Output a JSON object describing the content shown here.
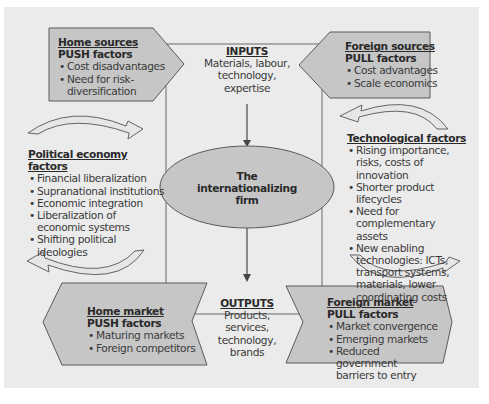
{
  "colors": {
    "background_panel": "#ebebeb",
    "shape_fill": "#c6c6c6",
    "shape_stroke": "#5a5a5a",
    "text": "#3a3a3a",
    "heading_text": "#2a2a2a"
  },
  "home_sources": {
    "title": "Home sources",
    "subtitle": "PUSH factors",
    "items": [
      "Cost disadvantages",
      "Need for risk-diversification"
    ]
  },
  "foreign_sources": {
    "title": "Foreign sources",
    "subtitle": "PULL factors",
    "items": [
      "Cost advantages",
      "Scale economics"
    ]
  },
  "inputs": {
    "title": "INPUTS",
    "text": "Materials, labour, technology, expertise"
  },
  "firm": {
    "line1": "The",
    "line2": "internationalizing",
    "line3": "firm"
  },
  "outputs": {
    "title": "OUTPUTS",
    "text": "Products, services, technology, brands"
  },
  "political_economy": {
    "title": "Political economy factors",
    "items": [
      "Financial liberalization",
      "Supranational institutions",
      "Economic integration",
      "Liberalization of economic systems",
      "Shifting political ideologies"
    ]
  },
  "technological": {
    "title": "Technological factors",
    "items": [
      "Rising importance, risks, costs of innovation",
      "Shorter product lifecycles",
      "Need for complementary assets",
      "New enabling technologies: ICTs, transport systems, materials, lower coordinating costs"
    ]
  },
  "home_market": {
    "title": "Home market",
    "subtitle": "PUSH factors",
    "items": [
      "Maturing markets",
      "Foreign competitors"
    ]
  },
  "foreign_market": {
    "title": "Foreign market",
    "subtitle": "PULL factors",
    "items": [
      "Market convergence",
      "Emerging markets",
      "Reduced government barriers to entry"
    ]
  }
}
